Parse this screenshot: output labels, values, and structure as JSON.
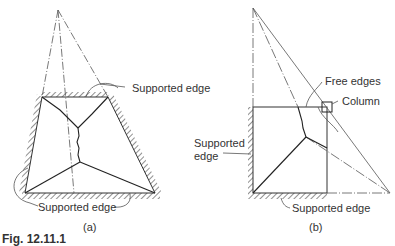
{
  "figure": {
    "caption": "Fig. 12.11.1",
    "panel_a": {
      "label": "(a)",
      "annotations": [
        "Supported edge",
        "Supported edge"
      ]
    },
    "panel_b": {
      "label": "(b)",
      "annotations": {
        "free_edges": "Free edges",
        "column": "Column",
        "supported_left_line1": "Supported",
        "supported_left_line2": "edge",
        "supported_bottom": "Supported edge"
      }
    }
  },
  "colors": {
    "line": "#333333",
    "background": "#ffffff"
  }
}
